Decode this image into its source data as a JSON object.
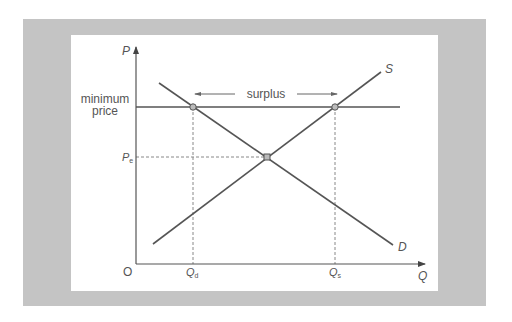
{
  "diagram": {
    "axes": {
      "y_label": "P",
      "x_label": "Q",
      "origin_label": "O"
    },
    "curves": {
      "supply_label": "S",
      "demand_label": "D"
    },
    "price_floor": {
      "label_line1": "minimum",
      "label_line2": "price"
    },
    "equilibrium_price_label": "P",
    "equilibrium_price_subscript": "e",
    "quantity_demanded_label": "Q",
    "quantity_demanded_subscript": "d",
    "quantity_supplied_label": "Q",
    "quantity_supplied_subscript": "s",
    "surplus_label": "surplus",
    "colors": {
      "frame": "#c4c4c4",
      "lines": "#555555",
      "dashed": "#888888",
      "points": "#bbbbbb"
    }
  }
}
